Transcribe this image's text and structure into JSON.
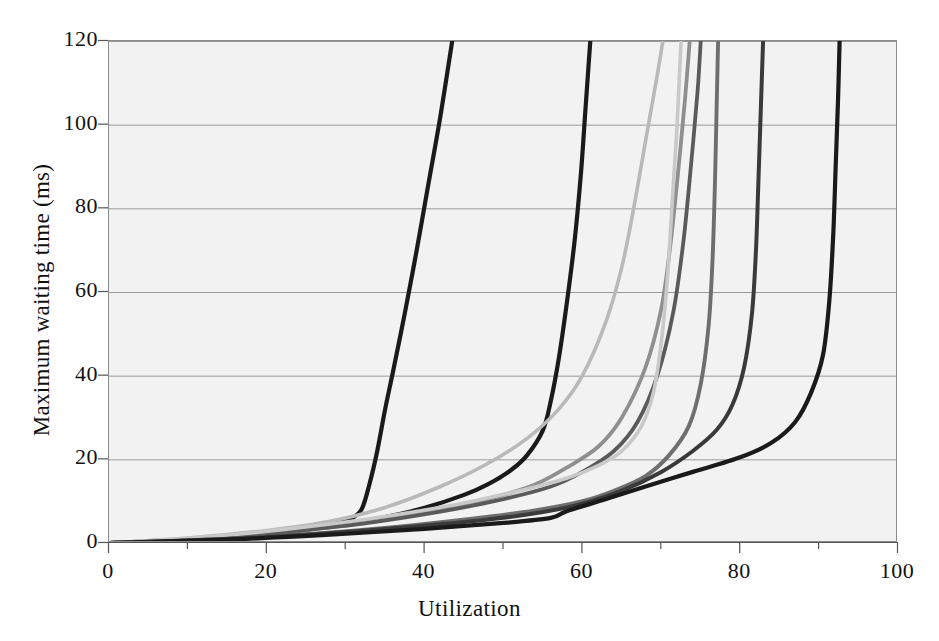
{
  "chart_data": {
    "type": "line",
    "title": "",
    "xlabel": "Utilization",
    "ylabel": "Maximum waiting time (ms)",
    "xlim": [
      0,
      100
    ],
    "ylim": [
      0,
      120
    ],
    "xticks": [
      "0",
      "20",
      "40",
      "60",
      "80",
      "100"
    ],
    "yticks": [
      "0",
      "20",
      "40",
      "60",
      "80",
      "100",
      "120"
    ],
    "xtick_values": [
      0,
      20,
      40,
      60,
      80,
      100
    ],
    "ytick_values": [
      0,
      20,
      40,
      60,
      80,
      100,
      120
    ],
    "x_minor_tick_step": 10,
    "grid": "horizontal",
    "legend": "none",
    "background": "#f2f2f2",
    "series": [
      {
        "name": "curve-1",
        "color": "#1a1a1a",
        "width": 4.2,
        "points": [
          [
            0,
            0
          ],
          [
            5,
            0.4
          ],
          [
            10,
            0.9
          ],
          [
            15,
            1.5
          ],
          [
            20,
            2.3
          ],
          [
            24,
            3.2
          ],
          [
            27,
            4.1
          ],
          [
            29,
            4.8
          ],
          [
            30.5,
            5.6
          ],
          [
            32,
            8
          ],
          [
            33,
            14
          ],
          [
            34,
            22
          ],
          [
            35,
            32
          ],
          [
            36,
            41
          ],
          [
            37.5,
            55
          ],
          [
            39,
            70
          ],
          [
            40.5,
            86
          ],
          [
            42,
            102
          ],
          [
            43.5,
            120
          ]
        ]
      },
      {
        "name": "curve-2",
        "color": "#1a1a1a",
        "width": 4.2,
        "points": [
          [
            0,
            0
          ],
          [
            8,
            0.6
          ],
          [
            15,
            1.3
          ],
          [
            20,
            2.0
          ],
          [
            25,
            3.2
          ],
          [
            30,
            4.6
          ],
          [
            35,
            6.2
          ],
          [
            40,
            8.4
          ],
          [
            45,
            11.5
          ],
          [
            48,
            14
          ],
          [
            51,
            17.5
          ],
          [
            53,
            21
          ],
          [
            55,
            27
          ],
          [
            56,
            34
          ],
          [
            57,
            44
          ],
          [
            58,
            57
          ],
          [
            59,
            72
          ],
          [
            59.8,
            88
          ],
          [
            60.4,
            104
          ],
          [
            61,
            120
          ]
        ]
      },
      {
        "name": "curve-3",
        "color": "#b9b9b9",
        "width": 3.6,
        "points": [
          [
            0,
            0
          ],
          [
            10,
            1.2
          ],
          [
            20,
            3.0
          ],
          [
            28,
            5.2
          ],
          [
            35,
            8.5
          ],
          [
            42,
            13.5
          ],
          [
            48,
            19
          ],
          [
            53,
            25
          ],
          [
            57,
            32
          ],
          [
            60,
            40
          ],
          [
            63,
            53
          ],
          [
            65,
            66
          ],
          [
            66.5,
            80
          ],
          [
            68,
            96
          ],
          [
            69.5,
            112
          ],
          [
            70.2,
            120
          ]
        ]
      },
      {
        "name": "curve-4",
        "color": "#8f8f8f",
        "width": 3.8,
        "points": [
          [
            0,
            0
          ],
          [
            10,
            0.8
          ],
          [
            20,
            2.2
          ],
          [
            30,
            4.2
          ],
          [
            40,
            7.2
          ],
          [
            48,
            10.5
          ],
          [
            54,
            14
          ],
          [
            58,
            18
          ],
          [
            62,
            23
          ],
          [
            65,
            30
          ],
          [
            68,
            42
          ],
          [
            70,
            56
          ],
          [
            71.2,
            72
          ],
          [
            72.2,
            90
          ],
          [
            73,
            106
          ],
          [
            73.6,
            120
          ]
        ]
      },
      {
        "name": "curve-5",
        "color": "#5a5a5a",
        "width": 3.8,
        "points": [
          [
            0,
            0
          ],
          [
            12,
            1.0
          ],
          [
            22,
            2.6
          ],
          [
            32,
            4.6
          ],
          [
            42,
            7.5
          ],
          [
            50,
            10.5
          ],
          [
            56,
            13.5
          ],
          [
            60,
            17
          ],
          [
            64,
            22
          ],
          [
            67,
            29
          ],
          [
            69.5,
            40
          ],
          [
            71.5,
            55
          ],
          [
            72.8,
            72
          ],
          [
            73.8,
            91
          ],
          [
            74.6,
            108
          ],
          [
            75,
            120
          ]
        ]
      },
      {
        "name": "curve-6",
        "color": "#c9c9c9",
        "width": 3.6,
        "points": [
          [
            0,
            0
          ],
          [
            12,
            1.4
          ],
          [
            22,
            3.2
          ],
          [
            33,
            5.8
          ],
          [
            44,
            9.2
          ],
          [
            52,
            12.5
          ],
          [
            58,
            15.5
          ],
          [
            62,
            18.5
          ],
          [
            65,
            22
          ],
          [
            67.5,
            28
          ],
          [
            69,
            36
          ],
          [
            70,
            48
          ],
          [
            70.8,
            64
          ],
          [
            71.4,
            82
          ],
          [
            72,
            100
          ],
          [
            72.5,
            120
          ]
        ]
      },
      {
        "name": "curve-7",
        "color": "#6e6e6e",
        "width": 3.9,
        "points": [
          [
            0,
            0
          ],
          [
            12,
            0.8
          ],
          [
            24,
            2.0
          ],
          [
            36,
            3.8
          ],
          [
            46,
            5.8
          ],
          [
            54,
            7.8
          ],
          [
            60,
            10
          ],
          [
            64,
            12.5
          ],
          [
            68,
            16
          ],
          [
            71,
            21
          ],
          [
            73.5,
            28
          ],
          [
            75,
            38
          ],
          [
            76,
            52
          ],
          [
            76.5,
            68
          ],
          [
            76.8,
            86
          ],
          [
            77,
            103
          ],
          [
            77.2,
            120
          ]
        ]
      },
      {
        "name": "curve-8",
        "color": "#3a3a3a",
        "width": 4.0,
        "points": [
          [
            0,
            0
          ],
          [
            14,
            0.9
          ],
          [
            26,
            2.1
          ],
          [
            38,
            3.8
          ],
          [
            48,
            5.6
          ],
          [
            55,
            7.4
          ],
          [
            60,
            9.4
          ],
          [
            65,
            12.5
          ],
          [
            70,
            17
          ],
          [
            74,
            22
          ],
          [
            77,
            27
          ],
          [
            79,
            33
          ],
          [
            80.5,
            42
          ],
          [
            81.5,
            55
          ],
          [
            82,
            70
          ],
          [
            82.3,
            86
          ],
          [
            82.6,
            103
          ],
          [
            82.9,
            120
          ]
        ]
      },
      {
        "name": "curve-9",
        "color": "#1a1a1a",
        "width": 4.2,
        "points": [
          [
            0,
            0
          ],
          [
            15,
            0.8
          ],
          [
            28,
            2.0
          ],
          [
            40,
            3.4
          ],
          [
            50,
            4.8
          ],
          [
            56,
            6.0
          ],
          [
            58,
            7.6
          ],
          [
            63,
            10.5
          ],
          [
            68,
            13.5
          ],
          [
            74,
            17
          ],
          [
            80,
            20.5
          ],
          [
            84,
            24
          ],
          [
            87,
            29
          ],
          [
            89,
            36
          ],
          [
            90.5,
            45
          ],
          [
            91.3,
            58
          ],
          [
            91.8,
            74
          ],
          [
            92.1,
            90
          ],
          [
            92.4,
            106
          ],
          [
            92.6,
            120
          ]
        ]
      }
    ]
  },
  "axes": {
    "x_title": "Utilization",
    "y_title": "Maximum waiting time (ms)"
  },
  "bleed_text": [
    {
      "text": "rated capacity of a link  while it is run",
      "x": 300,
      "y": 86,
      "size": 20
    },
    {
      "text": "tion of the queueing models",
      "x": 360,
      "y": 148,
      "size": 20
    },
    {
      "text": "ssage to travel",
      "x": 470,
      "y": 220,
      "size": 20
    },
    {
      "text": "maximal throughput of the network  Figure",
      "x": 170,
      "y": 345,
      "size": 20
    },
    {
      "text": "exponential with mean 1/μ. Values we can derive",
      "x": 150,
      "y": 402,
      "size": 19
    },
    {
      "text": "of the distribution of the predicted values",
      "x": 185,
      "y": 437,
      "size": 19
    },
    {
      "text": "how the maximum waiting time in ms",
      "x": 170,
      "y": 466,
      "size": 19
    },
    {
      "text": "the network load, based upon",
      "x": 225,
      "y": 497,
      "size": 19
    }
  ]
}
